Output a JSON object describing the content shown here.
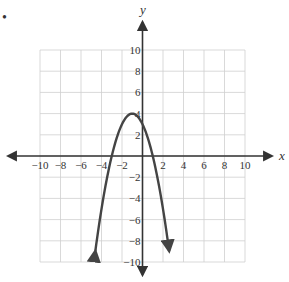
{
  "problem_marker": "•",
  "chart_data": {
    "type": "line",
    "title": "",
    "xlabel": "x",
    "ylabel": "y",
    "xlim": [
      -10,
      10
    ],
    "ylim": [
      -10,
      10
    ],
    "grid": true,
    "grid_step": 2,
    "x_ticks": [
      -10,
      -8,
      -6,
      -4,
      -2,
      2,
      4,
      6,
      8,
      10
    ],
    "y_ticks": [
      10,
      8,
      6,
      4,
      2,
      -2,
      -4,
      -6,
      -8,
      -10
    ],
    "series": [
      {
        "name": "parabola",
        "equation": "y = -(x+1)^2 + 4",
        "vertex": [
          -1,
          4
        ],
        "x_intercepts": [
          -3,
          1
        ],
        "y_intercept": 3,
        "endpoints_with_arrows": [
          [
            -4.6,
            -9.5
          ],
          [
            2.6,
            -9.5
          ]
        ],
        "color": "#444444"
      }
    ],
    "axis_arrows": true
  }
}
